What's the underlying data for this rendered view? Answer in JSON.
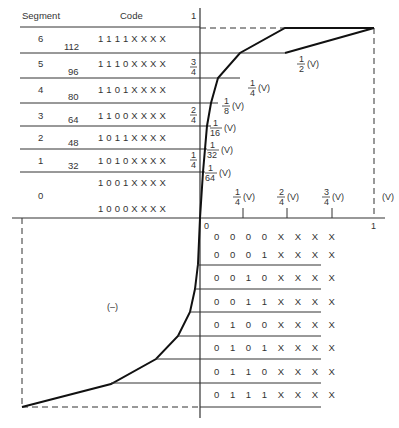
{
  "header": {
    "segment_label": "Segment",
    "code_label": "Code",
    "y_top_label": "1"
  },
  "positive_rows": [
    {
      "segment": "6",
      "level": "112",
      "code": "1 1 1 1 X X X X"
    },
    {
      "segment": "5",
      "level": "96",
      "code": "1 1 1 0 X X X X"
    },
    {
      "segment": "4",
      "level": "80",
      "code": "1 1 0 1 X X X X"
    },
    {
      "segment": "3",
      "level": "64",
      "code": "1 1 0 0 X X X X"
    },
    {
      "segment": "2",
      "level": "48",
      "code": "1 0 1 1 X X X X"
    },
    {
      "segment": "1",
      "level": "32",
      "code": "1 0 1 0 X X X X"
    },
    {
      "segment": "0",
      "level": "",
      "code": "1 0 0 1 X X X X"
    },
    {
      "segment": "",
      "level": "",
      "code": "1 0 0 0 X X X X"
    }
  ],
  "y_axis_fractions": [
    {
      "num": "3",
      "den": "4"
    },
    {
      "num": "2",
      "den": "4"
    },
    {
      "num": "1",
      "den": "4"
    }
  ],
  "slope_labels": [
    {
      "num": "1",
      "den": "2",
      "unit": "(V)"
    },
    {
      "num": "1",
      "den": "4",
      "unit": "(V)"
    },
    {
      "num": "1",
      "den": "8",
      "unit": "(V)"
    },
    {
      "num": "1",
      "den": "16",
      "unit": "(V)"
    },
    {
      "num": "1",
      "den": "32",
      "unit": "(V)"
    },
    {
      "num": "1",
      "den": "64",
      "unit": "(V)"
    }
  ],
  "x_axis": {
    "origin": "0",
    "end": "1",
    "unit": "(V)",
    "ticks": [
      {
        "num": "1",
        "den": "4",
        "unit": "(V)"
      },
      {
        "num": "2",
        "den": "4",
        "unit": "(V)"
      },
      {
        "num": "3",
        "den": "4",
        "unit": "(V)"
      }
    ]
  },
  "negative_region_label": "(–)",
  "negative_rows": [
    {
      "code": "0 0 0 0 X X X X"
    },
    {
      "code": "0 0 0 1 X X X X"
    },
    {
      "code": "0 0 1 0 X X X X"
    },
    {
      "code": "0 0 1 1 X X X X"
    },
    {
      "code": "0 1 0 0 X X X X"
    },
    {
      "code": "0 1 0 1 X X X X"
    },
    {
      "code": "0 1 1 0 X X X X"
    },
    {
      "code": "0 1 1 1 X X X X"
    }
  ]
}
